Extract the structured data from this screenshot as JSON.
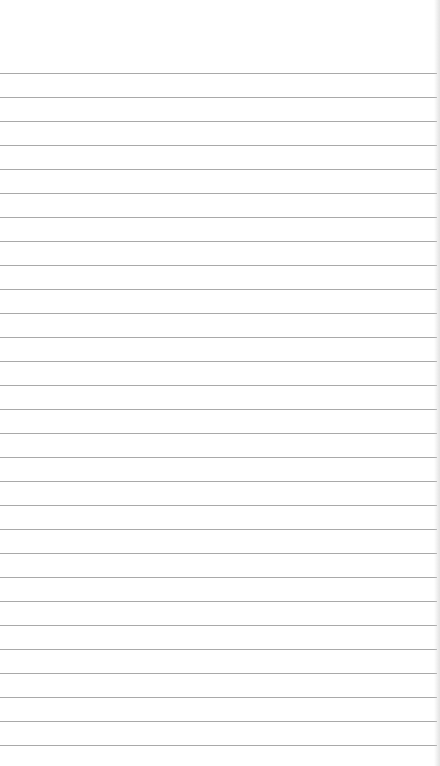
{
  "page": {
    "type": "lined-notepad-page",
    "line_color": "#a9a9a9",
    "background": "#ffffff",
    "first_line_y": 73,
    "line_spacing": 24,
    "line_count": 29,
    "text": ""
  }
}
